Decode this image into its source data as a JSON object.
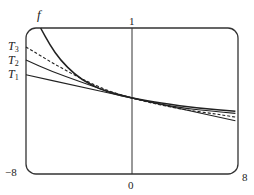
{
  "chart_data": {
    "type": "line",
    "title": "",
    "xlabel": "",
    "ylabel": "",
    "xlim": [
      -8,
      8
    ],
    "ylim": [
      -1,
      1
    ],
    "grid": false,
    "frame": "rounded-rectangle",
    "tick_labels": {
      "x_left": "−8",
      "x_origin": "0",
      "x_right": "8",
      "y_top": "1"
    },
    "series": [
      {
        "name": "f",
        "style": "solid",
        "points": [
          [
            -6.9,
            1.0
          ],
          [
            -6.2,
            0.77
          ],
          [
            -5.4,
            0.56
          ],
          [
            -4.3,
            0.36
          ],
          [
            -3.2,
            0.23
          ],
          [
            -1.7,
            0.11
          ],
          [
            0,
            0.04
          ],
          [
            2.1,
            -0.03
          ],
          [
            5.1,
            -0.1
          ],
          [
            7.8,
            -0.14
          ]
        ]
      },
      {
        "name": "T3",
        "style": "dashed",
        "points": [
          [
            -8,
            0.74
          ],
          [
            -6,
            0.52
          ],
          [
            -4,
            0.32
          ],
          [
            -2,
            0.15
          ],
          [
            0,
            0.04
          ],
          [
            2,
            -0.05
          ],
          [
            4,
            -0.12
          ],
          [
            6,
            -0.17
          ],
          [
            7.8,
            -0.22
          ]
        ]
      },
      {
        "name": "T2",
        "style": "solid",
        "points": [
          [
            -8,
            0.56
          ],
          [
            -6,
            0.4
          ],
          [
            -4,
            0.27
          ],
          [
            -2,
            0.14
          ],
          [
            0,
            0.04
          ],
          [
            2,
            -0.04
          ],
          [
            4,
            -0.1
          ],
          [
            6,
            -0.14
          ],
          [
            7.8,
            -0.17
          ]
        ]
      },
      {
        "name": "T1",
        "style": "solid",
        "points": [
          [
            -8,
            0.36
          ],
          [
            -4,
            0.2
          ],
          [
            0,
            0.04
          ],
          [
            4,
            -0.12
          ],
          [
            7.8,
            -0.27
          ]
        ]
      }
    ],
    "legend": {
      "position": "left-annotations",
      "entries": [
        "f",
        "T3",
        "T2",
        "T1"
      ]
    }
  },
  "labels": {
    "f": "f",
    "T3_main": "T",
    "T3_sub": "3",
    "T2_main": "T",
    "T2_sub": "2",
    "T1_main": "T",
    "T1_sub": "1",
    "y_top": "1",
    "x_left": "−8",
    "x_origin": "0",
    "x_right": "8"
  }
}
